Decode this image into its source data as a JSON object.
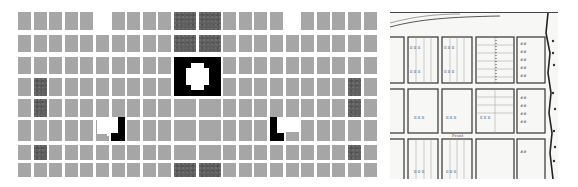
{
  "figure": {
    "left_panel": {
      "description": "Abstract grid diagram of city blocks",
      "rows": 8,
      "columns": 22,
      "colors": {
        "block": "#a6a6a6",
        "highlight_block": "#5e5e5e",
        "plaza": "#000000",
        "background": "#ffffff"
      },
      "highlight_blocks": [
        {
          "row": 0,
          "col": 10
        },
        {
          "row": 0,
          "col": 11
        },
        {
          "row": 1,
          "col": 10
        },
        {
          "row": 1,
          "col": 11
        },
        {
          "row": 3,
          "col": 1
        },
        {
          "row": 4,
          "col": 1
        },
        {
          "row": 6,
          "col": 1
        },
        {
          "row": 3,
          "col": 20
        },
        {
          "row": 4,
          "col": 20
        },
        {
          "row": 6,
          "col": 20
        },
        {
          "row": 7,
          "col": 10
        },
        {
          "row": 7,
          "col": 11
        }
      ],
      "missing_blocks": [
        {
          "row": 0,
          "col": 5
        },
        {
          "row": 0,
          "col": 16
        }
      ],
      "black_features": [
        {
          "name": "central-plaza",
          "rows": [
            2,
            3
          ],
          "cols": [
            10,
            11
          ]
        },
        {
          "name": "left-L-plaza",
          "row": 5,
          "col": 6
        },
        {
          "name": "right-L-plaza",
          "row": 5,
          "col": 15
        }
      ]
    },
    "right_panel": {
      "description": "Historic hand-drawn survey map of lots with shoreline on the right"
    }
  }
}
